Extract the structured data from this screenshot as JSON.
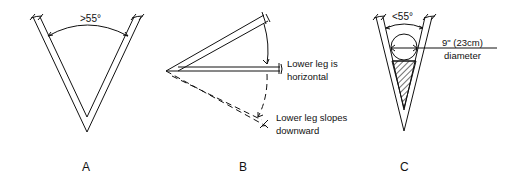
{
  "figures": [
    {
      "id": "A",
      "label": "A",
      "angle_label": ">55°"
    },
    {
      "id": "B",
      "label": "B",
      "annotation_horizontal_line1": "Lower leg is",
      "annotation_horizontal_line2": "horizontal",
      "annotation_downward_line1": "Lower leg slopes",
      "annotation_downward_line2": "downward"
    },
    {
      "id": "C",
      "label": "C",
      "angle_label": "<55°",
      "diameter_line1": "9\" (23cm)",
      "diameter_line2": "diameter"
    }
  ],
  "colors": {
    "ink": "#111111",
    "background": "#ffffff"
  }
}
